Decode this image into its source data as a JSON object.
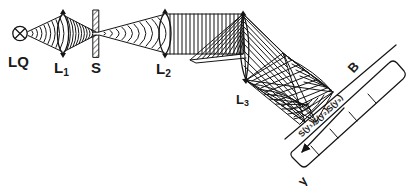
{
  "figure": {
    "type": "optical-schematic",
    "title_visible": false,
    "stroke_color": "#151515",
    "background_color": "#ffffff"
  },
  "components": {
    "source": {
      "label": "LQ",
      "symbol": "crossed-circle-icon",
      "x": 22,
      "y": 33
    },
    "lens1": {
      "label": "L",
      "subscript": "1",
      "symbol": "biconvex-lens-icon",
      "x": 63,
      "y": 33
    },
    "slit": {
      "label": "S",
      "symbol": "hatched-slit-icon",
      "x": 96,
      "y": 33
    },
    "lens2": {
      "label": "L",
      "subscript": "2",
      "symbol": "biconvex-lens-icon",
      "x": 164,
      "y": 33
    },
    "lens3": {
      "label": "L",
      "subscript": "3",
      "symbol": "cylindrical-lens-icon",
      "x": 243,
      "y": 84
    },
    "detector": {
      "label": "B",
      "symbol": "tilted-detector-strip-icon"
    }
  },
  "labels": {
    "source": "LQ",
    "lens1": "L",
    "lens1_sub": "1",
    "slit": "S",
    "lens2": "L",
    "lens2_sub": "2",
    "lens3": "L",
    "lens3_sub": "3",
    "detector": "B",
    "axis": "y",
    "spot1": "S(y₁)",
    "spot2": "S(y₂)",
    "spot3": "S(y₃)"
  }
}
